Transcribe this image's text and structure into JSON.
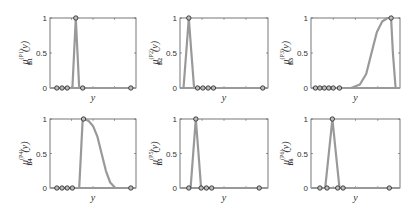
{
  "figure": {
    "xlabel": "y",
    "ytick_labels": [
      "0",
      "0.5",
      "1"
    ],
    "line_color": "#999999",
    "marker_color": "#222222",
    "axis_color": "#555555"
  },
  "chart_data": [
    {
      "type": "line",
      "panel": 1,
      "ylabel": "μ_{B_1}^{(P_1)}(y)",
      "xlabel": "y",
      "ylim": [
        0,
        1
      ],
      "x": [
        0,
        0.08,
        0.14,
        0.2,
        0.26,
        0.28,
        0.3,
        0.32,
        0.34,
        0.38,
        1.0
      ],
      "values": [
        0,
        0,
        0,
        0,
        0,
        0.5,
        1.0,
        0.5,
        0,
        0,
        0
      ],
      "markers": [
        {
          "x": 0.08,
          "y": 0
        },
        {
          "x": 0.14,
          "y": 0
        },
        {
          "x": 0.2,
          "y": 0
        },
        {
          "x": 0.3,
          "y": 1
        },
        {
          "x": 0.38,
          "y": 0
        },
        {
          "x": 0.94,
          "y": 0
        }
      ]
    },
    {
      "type": "line",
      "panel": 2,
      "ylabel": "μ_{B_2}^{(P_2)}(y)",
      "xlabel": "y",
      "ylim": [
        0,
        1
      ],
      "x": [
        0,
        0.04,
        0.07,
        0.1,
        0.13,
        0.16,
        1.0
      ],
      "values": [
        0,
        0,
        0.5,
        1.0,
        0.5,
        0,
        0
      ],
      "markers": [
        {
          "x": 0.1,
          "y": 1
        },
        {
          "x": 0.2,
          "y": 0
        },
        {
          "x": 0.26,
          "y": 0
        },
        {
          "x": 0.32,
          "y": 0
        },
        {
          "x": 0.38,
          "y": 0
        },
        {
          "x": 0.94,
          "y": 0
        }
      ]
    },
    {
      "type": "line",
      "panel": 3,
      "ylabel": "μ_{B_3}^{(P_3)}(y)",
      "xlabel": "y",
      "ylim": [
        0,
        1
      ],
      "x": [
        0,
        0.45,
        0.55,
        0.62,
        0.68,
        0.74,
        0.8,
        0.86,
        0.9,
        0.92,
        0.95,
        1.0
      ],
      "values": [
        0,
        0,
        0.05,
        0.2,
        0.5,
        0.8,
        0.95,
        1.0,
        1.0,
        0.5,
        0,
        0
      ],
      "markers": [
        {
          "x": 0.05,
          "y": 0
        },
        {
          "x": 0.1,
          "y": 0
        },
        {
          "x": 0.15,
          "y": 0
        },
        {
          "x": 0.2,
          "y": 0
        },
        {
          "x": 0.25,
          "y": 0
        },
        {
          "x": 0.32,
          "y": 0
        },
        {
          "x": 0.9,
          "y": 1
        }
      ]
    },
    {
      "type": "line",
      "panel": 4,
      "ylabel": "μ_{B_4}^{(P_4)}(y)",
      "xlabel": "y",
      "ylim": [
        0,
        1
      ],
      "x": [
        0,
        0.34,
        0.38,
        0.4,
        0.45,
        0.5,
        0.55,
        0.6,
        0.65,
        0.7,
        0.76,
        0.85,
        1.0
      ],
      "values": [
        0,
        0,
        1.0,
        1.0,
        0.97,
        0.9,
        0.75,
        0.5,
        0.25,
        0.08,
        0.0,
        0,
        0
      ],
      "markers": [
        {
          "x": 0.08,
          "y": 0
        },
        {
          "x": 0.14,
          "y": 0
        },
        {
          "x": 0.2,
          "y": 0
        },
        {
          "x": 0.26,
          "y": 0
        },
        {
          "x": 0.39,
          "y": 1
        },
        {
          "x": 0.94,
          "y": 0
        }
      ]
    },
    {
      "type": "line",
      "panel": 5,
      "ylabel": "μ_{B_5}^{(P_5)}(y)",
      "xlabel": "y",
      "ylim": [
        0,
        1
      ],
      "x": [
        0,
        0.12,
        0.15,
        0.18,
        0.21,
        0.24,
        1.0
      ],
      "values": [
        0,
        0,
        0.5,
        1.0,
        0.5,
        0,
        0
      ],
      "markers": [
        {
          "x": 0.1,
          "y": 0
        },
        {
          "x": 0.18,
          "y": 1
        },
        {
          "x": 0.24,
          "y": 0
        },
        {
          "x": 0.3,
          "y": 0
        },
        {
          "x": 0.36,
          "y": 0
        },
        {
          "x": 0.9,
          "y": 0
        }
      ]
    },
    {
      "type": "line",
      "panel": 6,
      "ylabel": "μ_{B_6}^{(P_6)}(y)",
      "xlabel": "y",
      "ylim": [
        0,
        1
      ],
      "x": [
        0,
        0.16,
        0.2,
        0.24,
        0.28,
        0.32,
        1.0
      ],
      "values": [
        0,
        0,
        0.5,
        1.0,
        0.5,
        0,
        0
      ],
      "markers": [
        {
          "x": 0.1,
          "y": 0
        },
        {
          "x": 0.18,
          "y": 0
        },
        {
          "x": 0.24,
          "y": 1
        },
        {
          "x": 0.3,
          "y": 0
        },
        {
          "x": 0.36,
          "y": 0
        },
        {
          "x": 0.88,
          "y": 0
        }
      ]
    }
  ]
}
